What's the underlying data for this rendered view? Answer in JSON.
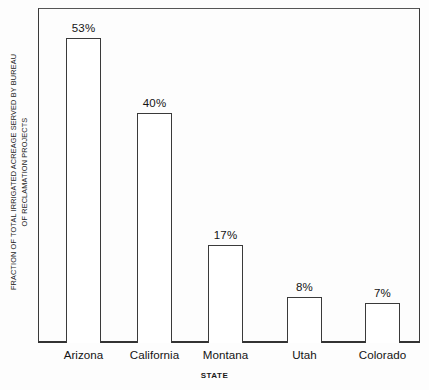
{
  "chart_data": {
    "type": "bar",
    "title": "",
    "categories": [
      "Arizona",
      "California",
      "Montana",
      "Utah",
      "Colorado"
    ],
    "values": [
      53,
      40,
      17,
      8,
      7
    ],
    "value_labels": [
      "53%",
      "40%",
      "17%",
      "8%",
      "7%"
    ],
    "xlabel": "STATE",
    "ylabel": "FRACTION OF TOTAL IRRIGATED ACREAGE SERVED BY BUREAU OF RECLAMATION PROJECTS",
    "ylabel_line1": "FRACTION OF TOTAL IRRIGATED ACREAGE SERVED BY BUREAU",
    "ylabel_line2": "OF RECLAMATION PROJECTS",
    "ylim": [
      0,
      58
    ],
    "ytick_labels": [],
    "grid": false,
    "legend": false,
    "units": "percent",
    "bar_fill_color": "#ffffff",
    "bar_edge_color": "#3a3a3a",
    "axis_color": "#333333",
    "background_color": "#fdfdfd",
    "text_color": "#141414"
  },
  "axes": {
    "x_axis_title": "STATE",
    "y_axis_title_line1": "FRACTION OF TOTAL IRRIGATED ACREAGE SERVED BY BUREAU",
    "y_axis_title_line2": "OF RECLAMATION PROJECTS"
  },
  "bars": [
    {
      "category": "Arizona",
      "value": 53,
      "label": "53%"
    },
    {
      "category": "California",
      "value": 40,
      "label": "40%"
    },
    {
      "category": "Montana",
      "value": 17,
      "label": "17%"
    },
    {
      "category": "Utah",
      "value": 8,
      "label": "8%"
    },
    {
      "category": "Colorado",
      "value": 7,
      "label": "7%"
    }
  ]
}
